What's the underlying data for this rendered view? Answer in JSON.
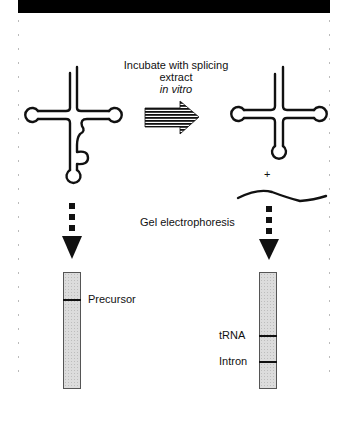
{
  "figure": {
    "step1": {
      "line1": "Incubate with  splicing",
      "line2": "extract",
      "line3": "in vitro"
    },
    "step2": {
      "label": "Gel electrophoresis"
    },
    "plus_sign": "+",
    "left": {
      "molecule": "pre-tRNA with intron (cloverleaf)",
      "lane": {
        "bands": [
          {
            "label": "Precursor",
            "y": 299
          }
        ]
      }
    },
    "right": {
      "molecule": "spliced tRNA (cloverleaf) + excised intron",
      "lane": {
        "bands": [
          {
            "label": "tRNA",
            "y": 335
          },
          {
            "label": "Intron",
            "y": 361
          }
        ]
      }
    },
    "colors": {
      "ink": "#111111",
      "gel": "#dcdcdc",
      "bar": "#000000"
    }
  }
}
